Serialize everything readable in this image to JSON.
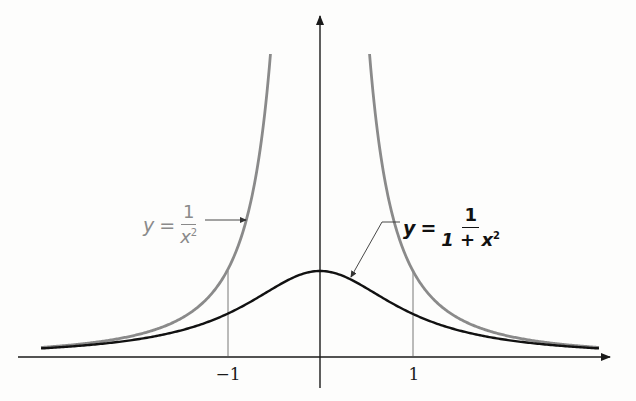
{
  "chart_data": {
    "type": "line",
    "title": "",
    "xlabel": "",
    "ylabel": "",
    "x_ticks": [
      -1,
      1
    ],
    "x_tick_labels": [
      "−1",
      "1"
    ],
    "grid": false,
    "xlim": [
      -3.0,
      3.0
    ],
    "ylim": [
      0,
      3.5
    ],
    "series": [
      {
        "name": "y = 1/x^2",
        "label_parts": {
          "lhs": "y",
          "eq": "=",
          "num": "1",
          "den": "x",
          "den_exp": "2"
        },
        "color": "#8a8a8a",
        "function": "1/x^2",
        "x": [
          -3.0,
          -2.5,
          -2.0,
          -1.5,
          -1.0,
          -0.8,
          -0.6,
          0.6,
          0.8,
          1.0,
          1.5,
          2.0,
          2.5,
          3.0
        ],
        "y": [
          0.111,
          0.16,
          0.25,
          0.444,
          1.0,
          1.5625,
          2.778,
          2.778,
          1.5625,
          1.0,
          0.444,
          0.25,
          0.16,
          0.111
        ]
      },
      {
        "name": "y = 1/(1+x^2)",
        "label_parts": {
          "lhs": "y",
          "eq": "=",
          "num": "1",
          "den": "1 + x",
          "den_exp": "2"
        },
        "color": "#111111",
        "function": "1/(1+x^2)",
        "x": [
          -3.0,
          -2.0,
          -1.0,
          -0.5,
          0.0,
          0.5,
          1.0,
          2.0,
          3.0
        ],
        "y": [
          0.1,
          0.2,
          0.5,
          0.8,
          1.0,
          0.8,
          0.5,
          0.2,
          0.1
        ]
      }
    ],
    "annotations": [
      {
        "type": "vertical-line",
        "x": -1,
        "from_y": 0,
        "to_y": 1
      },
      {
        "type": "vertical-line",
        "x": 1,
        "from_y": 0,
        "to_y": 1
      },
      {
        "type": "leader-arrow",
        "target": "y = 1/x^2",
        "side": "left"
      },
      {
        "type": "leader-arrow",
        "target": "y = 1/(1+x^2)",
        "side": "right"
      }
    ]
  },
  "axes": {
    "x_tick_neg": "−1",
    "x_tick_pos": "1"
  },
  "labels": {
    "gray": {
      "lhs": "y",
      "eq": "=",
      "num": "1",
      "den": "x",
      "exp": "2"
    },
    "black": {
      "lhs": "y",
      "eq": "=",
      "num": "1",
      "den": "1 + x",
      "exp": "2"
    }
  }
}
